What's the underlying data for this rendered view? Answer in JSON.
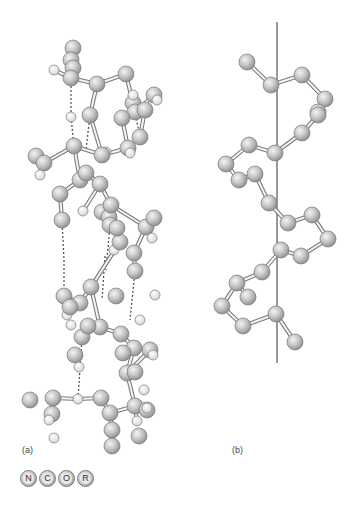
{
  "panels": {
    "a": {
      "label": "(a)"
    },
    "b": {
      "label": "(b)"
    }
  },
  "legend": [
    {
      "symbol": "N",
      "meaning": "nitrogen"
    },
    {
      "symbol": "C",
      "meaning": "carbon"
    },
    {
      "symbol": "O",
      "meaning": "oxygen"
    },
    {
      "symbol": "R",
      "meaning": "side chain"
    }
  ],
  "colors": {
    "atom_fill_light": "#f0f0f0",
    "atom_fill_mid": "#c4c4c4",
    "atom_fill_dark": "#8a8a8a",
    "hydrogen_fill": "#ffffff",
    "bond": "#888888",
    "hbond": "#555555",
    "axis": "#333333"
  },
  "diagram_a": {
    "atoms": [
      [
        73,
        48,
        8,
        "a"
      ],
      [
        71,
        60,
        8,
        "a"
      ],
      [
        73,
        68,
        8,
        "a"
      ],
      [
        71,
        78,
        8,
        "a"
      ],
      [
        54,
        70,
        5,
        "h"
      ],
      [
        97,
        84,
        8,
        "a"
      ],
      [
        126,
        74,
        8,
        "a"
      ],
      [
        154,
        95,
        8,
        "a"
      ],
      [
        133,
        103,
        8,
        "a"
      ],
      [
        133,
        95,
        5,
        "h"
      ],
      [
        135,
        112,
        8,
        "a"
      ],
      [
        145,
        110,
        8,
        "a"
      ],
      [
        122,
        118,
        8,
        "a"
      ],
      [
        140,
        137,
        8,
        "a"
      ],
      [
        128,
        148,
        8,
        "a"
      ],
      [
        130,
        153,
        5,
        "h"
      ],
      [
        157,
        100,
        5,
        "h"
      ],
      [
        71,
        117,
        5,
        "h"
      ],
      [
        90,
        115,
        8,
        "a"
      ],
      [
        106,
        152,
        5,
        "h"
      ],
      [
        102,
        155,
        8,
        "a"
      ],
      [
        74,
        146,
        8,
        "a"
      ],
      [
        36,
        156,
        8,
        "a"
      ],
      [
        44,
        163,
        8,
        "a"
      ],
      [
        40,
        175,
        5,
        "h"
      ],
      [
        80,
        180,
        8,
        "a"
      ],
      [
        86,
        173,
        8,
        "a"
      ],
      [
        60,
        194,
        8,
        "a"
      ],
      [
        62,
        220,
        8,
        "a"
      ],
      [
        100,
        184,
        8,
        "a"
      ],
      [
        102,
        212,
        8,
        "a"
      ],
      [
        109,
        217,
        8,
        "a"
      ],
      [
        111,
        205,
        8,
        "a"
      ],
      [
        83,
        211,
        5,
        "h"
      ],
      [
        114,
        250,
        5,
        "h"
      ],
      [
        110,
        225,
        8,
        "a"
      ],
      [
        146,
        227,
        8,
        "a"
      ],
      [
        120,
        242,
        8,
        "a"
      ],
      [
        135,
        271,
        8,
        "a"
      ],
      [
        154,
        218,
        8,
        "a"
      ],
      [
        152,
        238,
        5,
        "h"
      ],
      [
        117,
        228,
        8,
        "a"
      ],
      [
        134,
        253,
        8,
        "a"
      ],
      [
        91,
        287,
        8,
        "a"
      ],
      [
        64,
        296,
        8,
        "a"
      ],
      [
        80,
        303,
        8,
        "a"
      ],
      [
        67,
        315,
        5,
        "h"
      ],
      [
        100,
        327,
        8,
        "a"
      ],
      [
        82,
        337,
        8,
        "a"
      ],
      [
        70,
        307,
        8,
        "a"
      ],
      [
        71,
        325,
        5,
        "h"
      ],
      [
        121,
        334,
        8,
        "a"
      ],
      [
        134,
        348,
        8,
        "a"
      ],
      [
        140,
        320,
        5,
        "h"
      ],
      [
        88,
        326,
        8,
        "a"
      ],
      [
        116,
        296,
        8,
        "a"
      ],
      [
        155,
        295,
        5,
        "h"
      ],
      [
        123,
        353,
        8,
        "a"
      ],
      [
        127,
        373,
        8,
        "a"
      ],
      [
        135,
        372,
        8,
        "a"
      ],
      [
        150,
        350,
        8,
        "a"
      ],
      [
        153,
        355,
        5,
        "h"
      ],
      [
        75,
        355,
        8,
        "a"
      ],
      [
        79,
        367,
        5,
        "h"
      ],
      [
        101,
        398,
        8,
        "a"
      ],
      [
        78,
        399,
        5,
        "h"
      ],
      [
        53,
        398,
        8,
        "a"
      ],
      [
        135,
        406,
        8,
        "a"
      ],
      [
        137,
        421,
        5,
        "h"
      ],
      [
        110,
        413,
        8,
        "a"
      ],
      [
        52,
        414,
        8,
        "a"
      ],
      [
        49,
        420,
        5,
        "h"
      ],
      [
        144,
        390,
        5,
        "h"
      ],
      [
        112,
        430,
        8,
        "a"
      ],
      [
        147,
        410,
        8,
        "a"
      ],
      [
        54,
        438,
        5,
        "h"
      ],
      [
        112,
        446,
        8,
        "a"
      ],
      [
        147,
        408,
        5,
        "h"
      ],
      [
        30,
        400,
        8,
        "a"
      ],
      [
        139,
        436,
        8,
        "a"
      ]
    ],
    "bonds": [
      [
        73,
        68,
        71,
        78
      ],
      [
        71,
        78,
        54,
        70
      ],
      [
        71,
        78,
        97,
        84
      ],
      [
        97,
        84,
        126,
        74
      ],
      [
        126,
        74,
        135,
        112
      ],
      [
        135,
        112,
        154,
        95
      ],
      [
        135,
        112,
        145,
        110
      ],
      [
        145,
        110,
        140,
        137
      ],
      [
        135,
        112,
        122,
        118
      ],
      [
        122,
        118,
        128,
        148
      ],
      [
        128,
        148,
        102,
        155
      ],
      [
        102,
        155,
        74,
        146
      ],
      [
        74,
        146,
        44,
        163
      ],
      [
        44,
        163,
        40,
        175
      ],
      [
        74,
        146,
        80,
        180
      ],
      [
        80,
        180,
        86,
        173
      ],
      [
        86,
        173,
        100,
        184
      ],
      [
        100,
        184,
        111,
        205
      ],
      [
        111,
        205,
        102,
        212
      ],
      [
        100,
        184,
        83,
        211
      ],
      [
        80,
        180,
        60,
        194
      ],
      [
        60,
        194,
        62,
        220
      ],
      [
        111,
        205,
        146,
        227
      ],
      [
        146,
        227,
        154,
        218
      ],
      [
        146,
        227,
        134,
        253
      ],
      [
        134,
        253,
        135,
        271
      ],
      [
        111,
        205,
        117,
        228
      ],
      [
        117,
        228,
        120,
        242
      ],
      [
        120,
        242,
        91,
        287
      ],
      [
        91,
        287,
        80,
        303
      ],
      [
        80,
        303,
        64,
        296
      ],
      [
        80,
        303,
        67,
        315
      ],
      [
        91,
        287,
        100,
        327
      ],
      [
        100,
        327,
        121,
        334
      ],
      [
        121,
        334,
        134,
        348
      ],
      [
        100,
        327,
        88,
        326
      ],
      [
        88,
        326,
        82,
        337
      ],
      [
        134,
        348,
        127,
        373
      ],
      [
        127,
        373,
        150,
        350
      ],
      [
        127,
        373,
        135,
        406
      ],
      [
        135,
        406,
        137,
        421
      ],
      [
        135,
        406,
        110,
        413
      ],
      [
        110,
        413,
        101,
        398
      ],
      [
        110,
        413,
        112,
        430
      ],
      [
        112,
        430,
        112,
        446
      ],
      [
        101,
        398,
        78,
        399
      ],
      [
        78,
        399,
        53,
        398
      ],
      [
        53,
        398,
        52,
        414
      ],
      [
        52,
        414,
        49,
        420
      ],
      [
        97,
        84,
        90,
        115
      ],
      [
        90,
        115,
        102,
        155
      ]
    ],
    "hbonds": [
      [
        71,
        78,
        71,
        117
      ],
      [
        71,
        117,
        74,
        146
      ],
      [
        90,
        115,
        86,
        150
      ],
      [
        133,
        103,
        140,
        137
      ],
      [
        62,
        220,
        64,
        260
      ],
      [
        64,
        260,
        64,
        296
      ],
      [
        110,
        225,
        106,
        270
      ],
      [
        135,
        271,
        130,
        320
      ],
      [
        82,
        337,
        78,
        399
      ],
      [
        105,
        256,
        102,
        300
      ]
    ]
  },
  "diagram_b": {
    "axis": [
      277,
      22,
      277,
      363
    ],
    "atoms": [
      [
        247,
        62,
        8
      ],
      [
        271,
        85,
        8
      ],
      [
        302,
        75,
        8
      ],
      [
        325,
        99,
        8
      ],
      [
        318,
        112,
        8
      ],
      [
        318,
        115,
        8
      ],
      [
        302,
        133,
        8
      ],
      [
        275,
        153,
        8
      ],
      [
        249,
        145,
        8
      ],
      [
        226,
        164,
        8
      ],
      [
        239,
        180,
        8
      ],
      [
        255,
        174,
        8
      ],
      [
        269,
        203,
        8
      ],
      [
        288,
        223,
        8
      ],
      [
        312,
        215,
        8
      ],
      [
        328,
        239,
        8
      ],
      [
        301,
        256,
        8
      ],
      [
        281,
        250,
        8
      ],
      [
        262,
        272,
        8
      ],
      [
        237,
        283,
        8
      ],
      [
        248,
        297,
        8
      ],
      [
        222,
        306,
        8
      ],
      [
        243,
        326,
        8
      ],
      [
        276,
        314,
        8
      ],
      [
        295,
        342,
        8
      ]
    ],
    "bonds": [
      [
        247,
        62,
        271,
        85
      ],
      [
        271,
        85,
        302,
        75
      ],
      [
        302,
        75,
        325,
        99
      ],
      [
        325,
        99,
        318,
        115
      ],
      [
        318,
        115,
        302,
        133
      ],
      [
        302,
        133,
        275,
        153
      ],
      [
        275,
        153,
        249,
        145
      ],
      [
        249,
        145,
        226,
        164
      ],
      [
        226,
        164,
        239,
        180
      ],
      [
        239,
        180,
        255,
        174
      ],
      [
        255,
        174,
        269,
        203
      ],
      [
        269,
        203,
        288,
        223
      ],
      [
        288,
        223,
        312,
        215
      ],
      [
        312,
        215,
        328,
        239
      ],
      [
        328,
        239,
        301,
        256
      ],
      [
        301,
        256,
        281,
        250
      ],
      [
        281,
        250,
        262,
        272
      ],
      [
        262,
        272,
        237,
        283
      ],
      [
        237,
        283,
        248,
        297
      ],
      [
        237,
        283,
        222,
        306
      ],
      [
        222,
        306,
        243,
        326
      ],
      [
        243,
        326,
        276,
        314
      ],
      [
        276,
        314,
        295,
        342
      ]
    ]
  }
}
